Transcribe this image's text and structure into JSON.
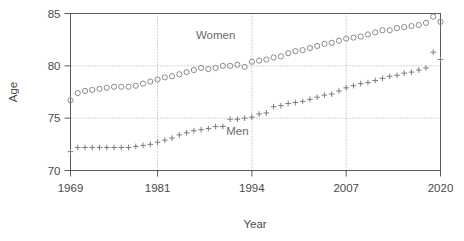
{
  "chart_data": {
    "type": "scatter",
    "title": "",
    "xlabel": "Year",
    "ylabel": "Age",
    "xlim": [
      1969,
      2020
    ],
    "ylim": [
      70,
      85
    ],
    "xticks": [
      1969,
      1981,
      1994,
      2007,
      2020
    ],
    "yticks": [
      70,
      75,
      80,
      85
    ],
    "grid": true,
    "legend_position": "inline-annotations",
    "annotations": [
      {
        "text": "Women",
        "x": 1989,
        "y": 82.6
      },
      {
        "text": "Men",
        "x": 1992,
        "y": 73.4
      }
    ],
    "x": [
      1969,
      1970,
      1971,
      1972,
      1973,
      1974,
      1975,
      1976,
      1977,
      1978,
      1979,
      1980,
      1981,
      1982,
      1983,
      1984,
      1985,
      1986,
      1987,
      1988,
      1989,
      1990,
      1991,
      1992,
      1993,
      1994,
      1995,
      1996,
      1997,
      1998,
      1999,
      2000,
      2001,
      2002,
      2003,
      2004,
      2005,
      2006,
      2007,
      2008,
      2009,
      2010,
      2011,
      2012,
      2013,
      2014,
      2015,
      2016,
      2017,
      2018,
      2019,
      2020
    ],
    "series": [
      {
        "name": "Women",
        "marker": "circle",
        "color": "#8a8a8a",
        "values": [
          76.7,
          77.4,
          77.6,
          77.7,
          77.8,
          77.9,
          78.0,
          78.0,
          78.0,
          78.1,
          78.3,
          78.5,
          78.7,
          78.9,
          79.0,
          79.2,
          79.4,
          79.6,
          79.8,
          79.7,
          79.8,
          80.0,
          80.0,
          80.1,
          79.9,
          80.4,
          80.5,
          80.6,
          80.8,
          80.9,
          81.2,
          81.4,
          81.5,
          81.7,
          81.9,
          82.1,
          82.2,
          82.4,
          82.6,
          82.7,
          82.8,
          83.0,
          83.2,
          83.4,
          83.4,
          83.6,
          83.7,
          83.8,
          83.9,
          84.1,
          84.7,
          84.2
        ]
      },
      {
        "name": "Men",
        "marker": "plus",
        "color": "#7d7d7d",
        "values": [
          71.8,
          72.2,
          72.2,
          72.2,
          72.2,
          72.2,
          72.2,
          72.2,
          72.2,
          72.3,
          72.4,
          72.5,
          72.7,
          72.9,
          73.1,
          73.4,
          73.6,
          73.8,
          73.9,
          74.0,
          74.2,
          74.2,
          74.9,
          74.9,
          75.0,
          75.1,
          75.4,
          75.5,
          76.1,
          76.2,
          76.4,
          76.5,
          76.6,
          76.8,
          77.0,
          77.2,
          77.3,
          77.6,
          77.9,
          78.1,
          78.3,
          78.4,
          78.6,
          78.8,
          79.0,
          79.1,
          79.3,
          79.4,
          79.6,
          79.8,
          81.3,
          80.6
        ]
      }
    ]
  }
}
